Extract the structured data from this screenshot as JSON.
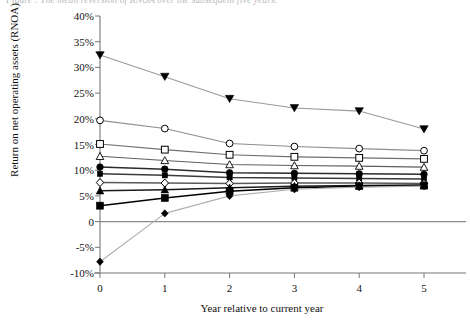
{
  "caption": "Figure : The mean reversion of RNOA over the subsequent five years.",
  "chart_data": {
    "type": "line",
    "title": "",
    "xlabel": "Year relative to current year",
    "ylabel": "Return on net operating assets (RNOA)",
    "x": [
      0,
      1,
      2,
      3,
      4,
      5
    ],
    "xtick_labels": [
      "0",
      "1",
      "2",
      "3",
      "4",
      "5"
    ],
    "xlim": [
      0,
      5
    ],
    "ylim": [
      -10,
      40
    ],
    "ytick_labels": [
      "40%",
      "35%",
      "30%",
      "25%",
      "20%",
      "15%",
      "10%",
      "5%",
      "0",
      "-5%",
      "-10%"
    ],
    "ytick_values": [
      40,
      35,
      30,
      25,
      20,
      15,
      10,
      5,
      0,
      -5,
      -10
    ],
    "grid": false,
    "legend": "none",
    "zero_line": true,
    "units": "percent",
    "series": [
      {
        "name": "Portfolio 1 (highest RNOA)",
        "marker": "triangle-down-filled",
        "color": "#9a9a9a",
        "marker_color": "#000000",
        "values": [
          32.4,
          28.2,
          23.9,
          22.1,
          21.5,
          18.0
        ]
      },
      {
        "name": "Portfolio 2",
        "marker": "circle-open",
        "color": "#8d8d8d",
        "marker_color": "#000000",
        "values": [
          19.7,
          18.1,
          15.2,
          14.6,
          14.2,
          13.8
        ]
      },
      {
        "name": "Portfolio 3",
        "marker": "square-open",
        "color": "#6f6f6f",
        "marker_color": "#000000",
        "values": [
          15.1,
          14.0,
          13.0,
          12.6,
          12.4,
          12.2
        ]
      },
      {
        "name": "Portfolio 4",
        "marker": "triangle-up-open",
        "color": "#5e5e5e",
        "marker_color": "#000000",
        "values": [
          12.7,
          11.9,
          11.1,
          10.9,
          10.8,
          10.6
        ]
      },
      {
        "name": "Portfolio 5",
        "marker": "circle-filled",
        "color": "#2b2b2b",
        "marker_color": "#000000",
        "values": [
          10.6,
          10.2,
          9.5,
          9.4,
          9.3,
          9.2
        ]
      },
      {
        "name": "Portfolio 6",
        "marker": "square-small-filled",
        "color": "#3a3a3a",
        "marker_color": "#000000",
        "values": [
          9.3,
          9.0,
          8.6,
          8.5,
          8.4,
          8.3
        ]
      },
      {
        "name": "Portfolio 7",
        "marker": "diamond-open",
        "color": "#5a5a5a",
        "marker_color": "#000000",
        "values": [
          7.6,
          7.5,
          7.4,
          7.5,
          7.5,
          7.4
        ]
      },
      {
        "name": "Portfolio 8",
        "marker": "triangle-up-filled",
        "color": "#1a1a1a",
        "marker_color": "#000000",
        "values": [
          6.0,
          6.2,
          6.6,
          6.9,
          7.0,
          7.1
        ]
      },
      {
        "name": "Portfolio 9",
        "marker": "square-filled",
        "color": "#000000",
        "marker_color": "#000000",
        "values": [
          3.1,
          4.6,
          5.9,
          6.6,
          6.9,
          7.0
        ]
      },
      {
        "name": "Portfolio 10 (lowest RNOA)",
        "marker": "diamond-filled",
        "color": "#b0b0b0",
        "marker_color": "#000000",
        "values": [
          -7.8,
          1.6,
          5.0,
          6.3,
          6.7,
          6.9
        ]
      }
    ]
  }
}
